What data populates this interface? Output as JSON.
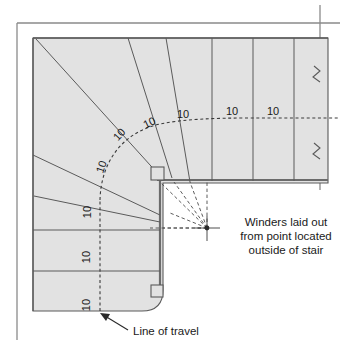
{
  "drawing": {
    "title": "Stair winder layout plan",
    "type": "architectural-plan",
    "fill_color": "#e2e2e2",
    "line_color": "#4a4a4a",
    "heavy_line_color": "#6b6b6b",
    "text_color": "#1a1a1a",
    "background": "#ffffff"
  },
  "dimensions": {
    "winder_labels": [
      {
        "id": "w1",
        "value": "10",
        "x": 90,
        "y": 305,
        "rotation": -90
      },
      {
        "id": "w2",
        "value": "10",
        "x": 90,
        "y": 257,
        "rotation": -90
      },
      {
        "id": "w3",
        "value": "10",
        "x": 91,
        "y": 212,
        "rotation": -90
      },
      {
        "id": "w4",
        "value": "10",
        "x": 105,
        "y": 168,
        "rotation": -72
      },
      {
        "id": "w5",
        "value": "10",
        "x": 122,
        "y": 137,
        "rotation": -48
      },
      {
        "id": "w6",
        "value": "10",
        "x": 151,
        "y": 126,
        "rotation": -26
      },
      {
        "id": "w7",
        "value": "10",
        "x": 183,
        "y": 118,
        "rotation": 0
      },
      {
        "id": "w8",
        "value": "10",
        "x": 232,
        "y": 115,
        "rotation": 0
      },
      {
        "id": "w9",
        "value": "10",
        "x": 273,
        "y": 115,
        "rotation": 0
      }
    ]
  },
  "annotations": {
    "pivot_note": {
      "lines": [
        "Winders laid out",
        "from point located",
        "outside of stair"
      ],
      "x": 286,
      "y": 228
    },
    "line_of_travel": {
      "label": "Line of travel",
      "x": 133,
      "y": 331
    }
  },
  "features": {
    "pivot_point": {
      "x": 207,
      "y": 228,
      "name": "layout-pivot-point"
    },
    "newel_upper": {
      "x": 151,
      "y": 173,
      "size": 12
    },
    "newel_lower": {
      "x": 156,
      "y": 291,
      "size": 11
    },
    "break_symbols": [
      {
        "x": 319,
        "y": 75
      },
      {
        "x": 319,
        "y": 152
      }
    ]
  }
}
